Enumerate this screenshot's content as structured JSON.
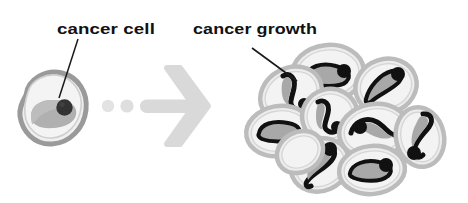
{
  "figure": {
    "background_color": "#ffffff",
    "width": 468,
    "height": 203
  },
  "labels": {
    "cancer_cell": "cancer cell",
    "cancer_growth": "cancer growth"
  },
  "colors": {
    "text": "#111111",
    "leader_line": "#1a1a1a",
    "arrow": "#d8d8d8",
    "dot": "#e2e2e2",
    "cell_outline": "#9a9a9a",
    "cell_body": "#efefef",
    "cell_inner": "#b0b0b0",
    "cell_nucleus": "#333333",
    "cluster_outline": "#b8b8b8",
    "cluster_body": "#ededed",
    "cluster_inner_fill": "#a8a8a8",
    "cluster_inner_stroke": "#111111",
    "cluster_nucleus": "#111111"
  },
  "diagram": {
    "single_cell": {
      "name": "cancer cell",
      "center_x": 53,
      "center_y": 115,
      "nucleus_x": 64,
      "nucleus_y": 108
    },
    "arrow": {
      "name": "progression arrow",
      "direction": "right",
      "dot_count": 2,
      "dots_x": [
        108,
        127
      ],
      "dots_y": 106,
      "shaft_start_x": 140,
      "tip_x": 207,
      "shaft_y": 106
    },
    "cluster": {
      "name": "cancer growth cell cluster",
      "cell_count": 10
    }
  },
  "leader_lines": {
    "cancer_cell": {
      "x1": 78,
      "y1": 39,
      "x2": 59,
      "y2": 98
    },
    "cancer_growth": {
      "x1": 252,
      "y1": 48,
      "x2": 297,
      "y2": 81
    }
  },
  "label_positions": {
    "cancer_cell": {
      "x": 57,
      "y": 34
    },
    "cancer_growth": {
      "x": 193,
      "y": 34
    }
  }
}
